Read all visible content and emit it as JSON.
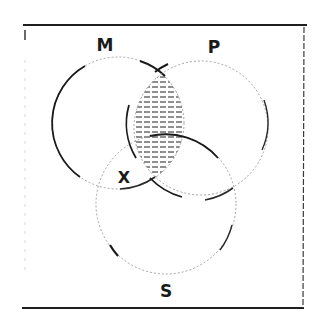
{
  "diagram": {
    "type": "venn-3",
    "style": "hand-drawn",
    "frame": {
      "stroke": "#2a2a2a"
    },
    "circles": [
      {
        "id": "M",
        "label": "M",
        "cx": 118,
        "cy": 123,
        "r": 66
      },
      {
        "id": "P",
        "label": "P",
        "cx": 201,
        "cy": 128,
        "r": 67
      },
      {
        "id": "S",
        "label": "S",
        "cx": 166,
        "cy": 204,
        "r": 70
      }
    ],
    "labels": {
      "m": "M",
      "p": "P",
      "s": "S",
      "x_mark": "X"
    },
    "shaded_region": "M ∩ P",
    "x_mark_region": "M ∩ S (outside P)",
    "colors": {
      "ink": "#1a1a1a",
      "hatch": "#333333",
      "background": "#ffffff"
    }
  }
}
